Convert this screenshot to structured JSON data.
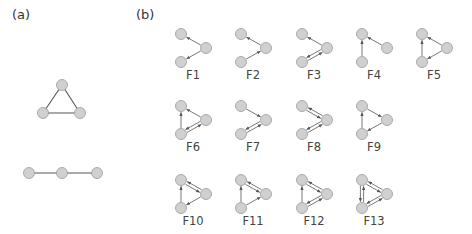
{
  "panel_a": {
    "label": "(a)",
    "graphs": [
      {
        "name": "triangle",
        "nodes": [
          [
            62,
            85
          ],
          [
            43,
            113
          ],
          [
            80,
            113
          ]
        ],
        "edges": [
          [
            0,
            1
          ],
          [
            0,
            2
          ],
          [
            1,
            2
          ]
        ]
      },
      {
        "name": "line",
        "nodes": [
          [
            29,
            173
          ],
          [
            62,
            173
          ],
          [
            97,
            173
          ]
        ],
        "edges": [
          [
            0,
            1
          ],
          [
            1,
            2
          ]
        ]
      }
    ]
  },
  "panel_b": {
    "label": "(b)",
    "node_layout": {
      "TL": [
        0,
        0
      ],
      "R": [
        25,
        14
      ],
      "BL": [
        0,
        28
      ]
    },
    "motifs": [
      {
        "label": "F1",
        "origin": [
          181,
          34
        ],
        "edges": [
          [
            "R",
            "TL"
          ],
          [
            "R",
            "BL"
          ]
        ]
      },
      {
        "label": "F2",
        "origin": [
          241,
          34
        ],
        "edges": [
          [
            "BL",
            "R"
          ],
          [
            "R",
            "TL"
          ]
        ]
      },
      {
        "label": "F3",
        "origin": [
          302,
          34
        ],
        "edges": [
          [
            "R",
            "TL"
          ],
          [
            "R",
            "BL"
          ],
          [
            "BL",
            "R"
          ]
        ]
      },
      {
        "label": "F4",
        "origin": [
          362,
          34
        ],
        "edges": [
          [
            "BL",
            "TL"
          ],
          [
            "R",
            "TL"
          ]
        ]
      },
      {
        "label": "F5",
        "origin": [
          422,
          34
        ],
        "edges": [
          [
            "R",
            "TL"
          ],
          [
            "BL",
            "TL"
          ],
          [
            "R",
            "BL"
          ]
        ]
      },
      {
        "label": "F6",
        "origin": [
          181,
          106
        ],
        "edges": [
          [
            "R",
            "TL"
          ],
          [
            "BL",
            "TL"
          ],
          [
            "R",
            "BL"
          ],
          [
            "BL",
            "R"
          ]
        ]
      },
      {
        "label": "F7",
        "origin": [
          241,
          106
        ],
        "edges": [
          [
            "TL",
            "R"
          ],
          [
            "R",
            "BL"
          ],
          [
            "BL",
            "R"
          ]
        ]
      },
      {
        "label": "F8",
        "origin": [
          302,
          106
        ],
        "edges": [
          [
            "TL",
            "R"
          ],
          [
            "R",
            "TL"
          ],
          [
            "R",
            "BL"
          ],
          [
            "BL",
            "R"
          ]
        ]
      },
      {
        "label": "F9",
        "origin": [
          362,
          106
        ],
        "edges": [
          [
            "TL",
            "R"
          ],
          [
            "R",
            "BL"
          ],
          [
            "BL",
            "TL"
          ]
        ]
      },
      {
        "label": "F10",
        "origin": [
          181,
          180
        ],
        "edges": [
          [
            "TL",
            "R"
          ],
          [
            "R",
            "TL"
          ],
          [
            "R",
            "BL"
          ],
          [
            "BL",
            "TL"
          ]
        ]
      },
      {
        "label": "F11",
        "origin": [
          241,
          180
        ],
        "edges": [
          [
            "TL",
            "R"
          ],
          [
            "R",
            "TL"
          ],
          [
            "BL",
            "R"
          ],
          [
            "BL",
            "TL"
          ]
        ]
      },
      {
        "label": "F12",
        "origin": [
          302,
          180
        ],
        "edges": [
          [
            "TL",
            "R"
          ],
          [
            "R",
            "TL"
          ],
          [
            "R",
            "BL"
          ],
          [
            "BL",
            "R"
          ],
          [
            "BL",
            "TL"
          ]
        ]
      },
      {
        "label": "F13",
        "origin": [
          362,
          180
        ],
        "edges": [
          [
            "TL",
            "R"
          ],
          [
            "R",
            "TL"
          ],
          [
            "R",
            "BL"
          ],
          [
            "BL",
            "R"
          ],
          [
            "BL",
            "TL"
          ],
          [
            "TL",
            "BL"
          ]
        ]
      }
    ]
  },
  "style": {
    "node_fill": "#d0d0d0",
    "node_stroke": "#9a9a9a",
    "edge_color": "#555555",
    "node_radius": 5.5
  }
}
